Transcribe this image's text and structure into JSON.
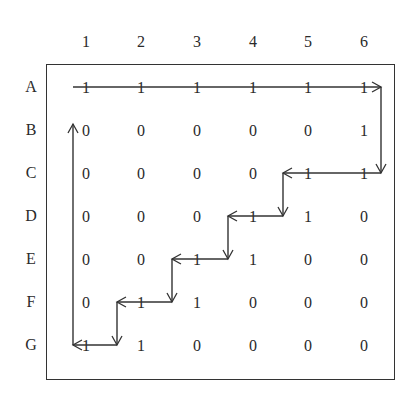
{
  "diagram": {
    "column_headers": [
      "1",
      "2",
      "3",
      "4",
      "5",
      "6"
    ],
    "row_headers": [
      "A",
      "B",
      "C",
      "D",
      "E",
      "F",
      "G"
    ],
    "matrix": [
      [
        "1",
        "1",
        "1",
        "1",
        "1",
        "1"
      ],
      [
        "0",
        "0",
        "0",
        "0",
        "0",
        "1"
      ],
      [
        "0",
        "0",
        "0",
        "0",
        "1",
        "1"
      ],
      [
        "0",
        "0",
        "0",
        "1",
        "1",
        "0"
      ],
      [
        "0",
        "0",
        "1",
        "1",
        "0",
        "0"
      ],
      [
        "0",
        "1",
        "1",
        "0",
        "0",
        "0"
      ],
      [
        "1",
        "1",
        "0",
        "0",
        "0",
        "0"
      ]
    ],
    "path_description": "Arrow path traverses row A left to right, down column 6, then staircase left/down through C5, D4, E3, F2 to G1, then up column 1 to row B",
    "stroke_color": "#333333"
  }
}
